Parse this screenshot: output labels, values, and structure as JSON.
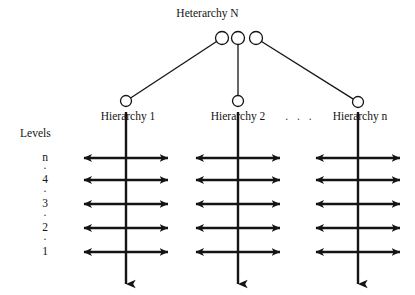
{
  "diagram": {
    "type": "heterarchy-hierarchy-tree",
    "root": {
      "label": "Heterarchy N",
      "label_x": 247,
      "label_y": 14,
      "nodes": [
        {
          "name": "root-node-left",
          "cx": 222,
          "cy": 38,
          "r": 6.5
        },
        {
          "name": "root-node-middle",
          "cx": 238,
          "cy": 38,
          "r": 6.5
        },
        {
          "name": "root-node-right",
          "cx": 256,
          "cy": 38,
          "r": 6.5
        }
      ]
    },
    "hierarchies": [
      {
        "id": "hierarchy-1",
        "label": "Hierarchy 1",
        "node_cx": 126,
        "node_cy": 101,
        "node_r": 5.5,
        "axis_x": 126,
        "edge_from_root_node": "root-node-left"
      },
      {
        "id": "hierarchy-2",
        "label": "Hierarchy 2",
        "node_cx": 238,
        "node_cy": 101,
        "node_r": 5.5,
        "axis_x": 238,
        "edge_from_root_node": "root-node-middle"
      },
      {
        "id": "hierarchy-n",
        "label": "Hierarchy n",
        "node_cx": 358,
        "node_cy": 102,
        "node_r": 5.5,
        "axis_x": 358,
        "edge_from_root_node": "root-node-right"
      }
    ],
    "ellipsis": ". . .",
    "levels_axis": {
      "title": "Levels",
      "title_x": 20,
      "title_y": 128,
      "label_x": 45,
      "entries": [
        {
          "label": "n",
          "kind": "level",
          "y": 158
        },
        {
          "label": "·",
          "kind": "dot",
          "y": 169
        },
        {
          "label": "4",
          "kind": "level",
          "y": 180
        },
        {
          "label": "·",
          "kind": "dot",
          "y": 192
        },
        {
          "label": "3",
          "kind": "level",
          "y": 204
        },
        {
          "label": "·",
          "kind": "dot",
          "y": 216
        },
        {
          "label": "2",
          "kind": "level",
          "y": 228
        },
        {
          "label": "·",
          "kind": "dot",
          "y": 240
        },
        {
          "label": "1",
          "kind": "level",
          "y": 252
        }
      ]
    },
    "level_rows_y": [
      158,
      180,
      204,
      228,
      252
    ],
    "horizontal_arrow_half_span": 42,
    "vertical_axis_top_y": 112,
    "vertical_axis_bottom_y": 284,
    "stroke_color": "#141414",
    "stroke_width_thin": 1.3,
    "stroke_width_thick": 2.4,
    "background_color": "#ffffff"
  }
}
